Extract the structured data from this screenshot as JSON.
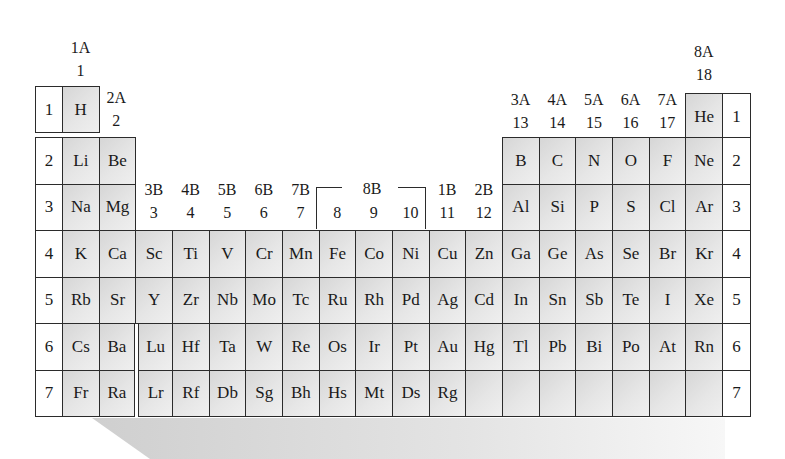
{
  "group_labels": {
    "g1": {
      "ab": "1A",
      "num": "1"
    },
    "g2": {
      "ab": "2A",
      "num": "2"
    },
    "g3": {
      "ab": "3B",
      "num": "3"
    },
    "g4": {
      "ab": "4B",
      "num": "4"
    },
    "g5": {
      "ab": "5B",
      "num": "5"
    },
    "g6": {
      "ab": "6B",
      "num": "6"
    },
    "g7": {
      "ab": "7B",
      "num": "7"
    },
    "g8b": {
      "ab": "8B"
    },
    "g8": {
      "num": "8"
    },
    "g9": {
      "num": "9"
    },
    "g10": {
      "num": "10"
    },
    "g11": {
      "ab": "1B",
      "num": "11"
    },
    "g12": {
      "ab": "2B",
      "num": "12"
    },
    "g13": {
      "ab": "3A",
      "num": "13"
    },
    "g14": {
      "ab": "4A",
      "num": "14"
    },
    "g15": {
      "ab": "5A",
      "num": "15"
    },
    "g16": {
      "ab": "6A",
      "num": "16"
    },
    "g17": {
      "ab": "7A",
      "num": "17"
    },
    "g18": {
      "ab": "8A",
      "num": "18"
    }
  },
  "periods": [
    "1",
    "2",
    "3",
    "4",
    "5",
    "6",
    "7"
  ],
  "rows": {
    "p1": {
      "H": "H",
      "He": "He"
    },
    "p2": [
      "Li",
      "Be",
      "B",
      "C",
      "N",
      "O",
      "F",
      "Ne"
    ],
    "p3": [
      "Na",
      "Mg",
      "Al",
      "Si",
      "P",
      "S",
      "Cl",
      "Ar"
    ],
    "p4": [
      "K",
      "Ca",
      "Sc",
      "Ti",
      "V",
      "Cr",
      "Mn",
      "Fe",
      "Co",
      "Ni",
      "Cu",
      "Zn",
      "Ga",
      "Ge",
      "As",
      "Se",
      "Br",
      "Kr"
    ],
    "p5": [
      "Rb",
      "Sr",
      "Y",
      "Zr",
      "Nb",
      "Mo",
      "Tc",
      "Ru",
      "Rh",
      "Pd",
      "Ag",
      "Cd",
      "In",
      "Sn",
      "Sb",
      "Te",
      "I",
      "Xe"
    ],
    "p6": [
      "Cs",
      "Ba",
      "Lu",
      "Hf",
      "Ta",
      "W",
      "Re",
      "Os",
      "Ir",
      "Pt",
      "Au",
      "Hg",
      "Tl",
      "Pb",
      "Bi",
      "Po",
      "At",
      "Rn"
    ],
    "p7": [
      "Fr",
      "Ra",
      "Lr",
      "Rf",
      "Db",
      "Sg",
      "Bh",
      "Hs",
      "Mt",
      "Ds",
      "Rg",
      "",
      "",
      "",
      "",
      "",
      "",
      ""
    ]
  },
  "colors": {
    "cell_fill": "#e2e2e2",
    "border": "#2b2b2b",
    "decor": "#d9d9d9"
  }
}
